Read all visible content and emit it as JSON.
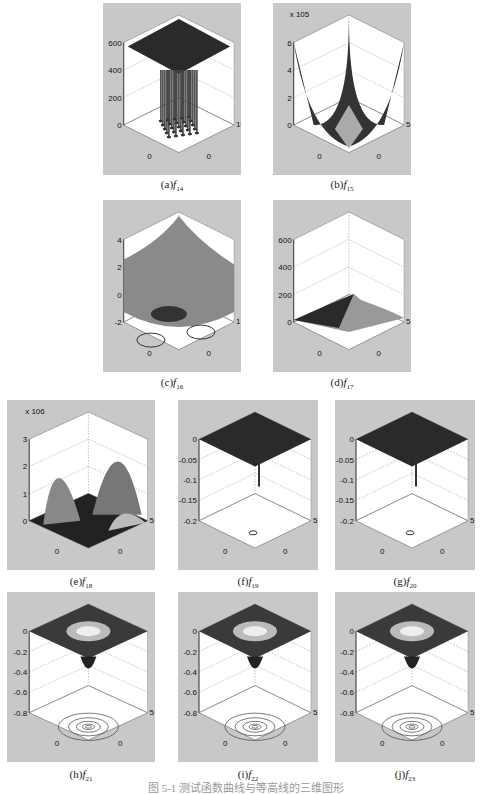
{
  "figure": {
    "caption": "图 5-1  测试函数曲线与等高线的三维图形",
    "panels": [
      {
        "id": "a",
        "label": "(a)",
        "func": "f",
        "sub": "14"
      },
      {
        "id": "b",
        "label": "(b)",
        "func": "f",
        "sub": "15"
      },
      {
        "id": "c",
        "label": "(c)",
        "func": "f",
        "sub": "16"
      },
      {
        "id": "d",
        "label": "(d)",
        "func": "f",
        "sub": "17"
      },
      {
        "id": "e",
        "label": "(e)",
        "func": "f",
        "sub": "18"
      },
      {
        "id": "f",
        "label": "(f)",
        "func": "f",
        "sub": "19"
      },
      {
        "id": "g",
        "label": "(g)",
        "func": "f",
        "sub": "20"
      },
      {
        "id": "h",
        "label": "(h)",
        "func": "f",
        "sub": "21"
      },
      {
        "id": "i",
        "label": "(i)",
        "func": "f",
        "sub": "22"
      },
      {
        "id": "j",
        "label": "(j)",
        "func": "f",
        "sub": "23"
      }
    ]
  },
  "chart_data": [
    {
      "type": "surface3d",
      "title": "(a) f14",
      "xlabel": "x1",
      "ylabel": "x2",
      "zticks": [
        "0",
        "200",
        "400",
        "600"
      ],
      "xticks": [
        "-100",
        "0",
        "100"
      ],
      "yticks": [
        "-100",
        "0",
        "100"
      ],
      "zlim": [
        0,
        600
      ]
    },
    {
      "type": "surface3d",
      "title": "(b) f15",
      "xlabel": "x1",
      "ylabel": "x2",
      "zscale": "x 10^5",
      "zticks": [
        "0",
        "2",
        "4",
        "6"
      ],
      "xticks": [
        "-5",
        "0",
        "5"
      ],
      "yticks": [
        "-5",
        "0",
        "5"
      ],
      "zlim": [
        0,
        6
      ]
    },
    {
      "type": "surface3d",
      "title": "(c) f16",
      "xlabel": "x1",
      "ylabel": "x2",
      "zticks": [
        "-2",
        "0",
        "2",
        "4"
      ],
      "xticks": [
        "-1",
        "0",
        "1"
      ],
      "yticks": [
        "-1",
        "0",
        "1"
      ],
      "zlim": [
        -2,
        4
      ],
      "contour": true
    },
    {
      "type": "surface3d",
      "title": "(d) f17",
      "xlabel": "x1",
      "ylabel": "x2",
      "zticks": [
        "0",
        "200",
        "400",
        "600"
      ],
      "xticks": [
        "-5",
        "0",
        "5"
      ],
      "yticks": [
        "-5",
        "0",
        "5"
      ],
      "zlim": [
        0,
        600
      ],
      "contour": true
    },
    {
      "type": "surface3d",
      "title": "(e) f18",
      "xlabel": "x1",
      "ylabel": "x2",
      "zscale": "x 10^6",
      "zticks": [
        "0",
        "1",
        "2",
        "3"
      ],
      "xticks": [
        "-5",
        "0",
        "5"
      ],
      "yticks": [
        "-5",
        "0",
        "5"
      ],
      "zlim": [
        0,
        3
      ],
      "contour": true
    },
    {
      "type": "surface3d",
      "title": "(f) f19",
      "xlabel": "x1",
      "ylabel": "x2",
      "zticks": [
        "-0.2",
        "-0.15",
        "-0.1",
        "-0.05",
        "0"
      ],
      "xticks": [
        "-5",
        "0",
        "5"
      ],
      "yticks": [
        "-5",
        "0",
        "5"
      ],
      "zlim": [
        -0.2,
        0
      ],
      "contour": true
    },
    {
      "type": "surface3d",
      "title": "(g) f20",
      "xlabel": "x1",
      "ylabel": "x2",
      "zticks": [
        "-0.2",
        "-0.15",
        "-0.1",
        "-0.05",
        "0"
      ],
      "xticks": [
        "-5",
        "0",
        "5"
      ],
      "yticks": [
        "-5",
        "0",
        "5"
      ],
      "zlim": [
        -0.2,
        0
      ],
      "contour": true
    },
    {
      "type": "surface3d",
      "title": "(h) f21",
      "xlabel": "x1",
      "ylabel": "x2",
      "zticks": [
        "-0.8",
        "-0.6",
        "-0.4",
        "-0.2",
        "0"
      ],
      "xticks": [
        "-5",
        "0",
        "5"
      ],
      "yticks": [
        "-5",
        "0",
        "5"
      ],
      "zlim": [
        -0.8,
        0
      ],
      "contour": true
    },
    {
      "type": "surface3d",
      "title": "(i) f22",
      "xlabel": "x1",
      "ylabel": "x2",
      "zticks": [
        "-0.8",
        "-0.6",
        "-0.4",
        "-0.2",
        "0"
      ],
      "xticks": [
        "-5",
        "0",
        "5"
      ],
      "yticks": [
        "-5",
        "0",
        "5"
      ],
      "zlim": [
        -0.8,
        0
      ],
      "contour": true
    },
    {
      "type": "surface3d",
      "title": "(j) f23",
      "xlabel": "x1",
      "ylabel": "x2",
      "zticks": [
        "-0.8",
        "-0.6",
        "-0.4",
        "-0.2",
        "0"
      ],
      "xticks": [
        "-5",
        "0",
        "5"
      ],
      "yticks": [
        "-5",
        "0",
        "5"
      ],
      "zlim": [
        -0.8,
        0
      ],
      "contour": true
    }
  ]
}
